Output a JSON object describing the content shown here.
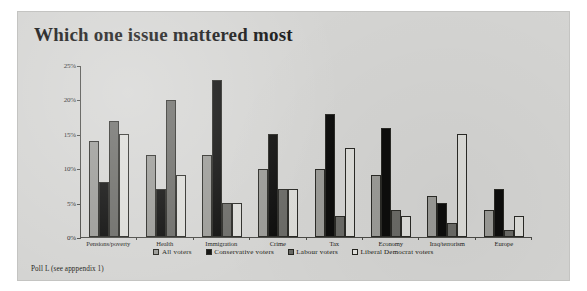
{
  "page": {
    "title": "Which one issue mattered most",
    "source_note": "Poll L (see apppendix 1)",
    "background_color": "#d4d4d2"
  },
  "chart_data": {
    "type": "bar",
    "title": "Which one issue mattered most",
    "xlabel": "",
    "ylabel": "",
    "ylim": [
      0,
      25
    ],
    "grid": false,
    "legend_position": "bottom",
    "y_ticks": [
      "0%",
      "5%",
      "10%",
      "15%",
      "20%",
      "25%"
    ],
    "y_tick_values": [
      0,
      5,
      10,
      15,
      20,
      25
    ],
    "categories": [
      "Pensions/poverty",
      "Health",
      "Immigration",
      "Crime",
      "Tax",
      "Economy",
      "Iraq/terrorism",
      "Europe"
    ],
    "series": [
      {
        "name": "All voters",
        "color": "#9a9a96",
        "values": [
          14,
          12,
          12,
          10,
          10,
          9,
          6,
          4
        ]
      },
      {
        "name": "Conservative voters",
        "color": "#0d0d0c",
        "values": [
          8,
          7,
          23,
          15,
          18,
          16,
          5,
          7
        ]
      },
      {
        "name": "Labour voters",
        "color": "#6a6a66",
        "values": [
          17,
          20,
          5,
          7,
          3,
          4,
          2,
          1
        ]
      },
      {
        "name": "Liberal Democrat voters",
        "color": "#dcdcd8",
        "values": [
          15,
          9,
          5,
          7,
          13,
          3,
          15,
          3
        ]
      }
    ]
  }
}
